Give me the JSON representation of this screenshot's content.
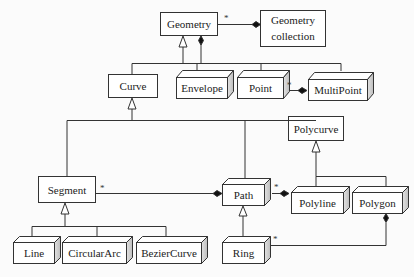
{
  "diagram": {
    "type": "UML class diagram",
    "classes": {
      "geometry": "Geometry",
      "geometry_collection_line1": "Geometry",
      "geometry_collection_line2": "collection",
      "curve": "Curve",
      "envelope": "Envelope",
      "point": "Point",
      "multipoint": "MultiPoint",
      "polycurve": "Polycurve",
      "segment": "Segment",
      "path": "Path",
      "polyline": "Polyline",
      "polygon": "Polygon",
      "line": "Line",
      "circular_arc": "CircularArc",
      "bezier_curve": "BezierCurve",
      "ring": "Ring"
    },
    "multiplicities": {
      "geometry_to_collection": "*",
      "point_to_multipoint": "*",
      "segment_to_path": "*",
      "path_to_polyline": "*",
      "ring_to_polygon": "*"
    },
    "relationships": [
      {
        "from": "Curve",
        "to": "Geometry",
        "kind": "generalization"
      },
      {
        "from": "Envelope",
        "to": "Geometry",
        "kind": "generalization"
      },
      {
        "from": "Point",
        "to": "Geometry",
        "kind": "generalization"
      },
      {
        "from": "MultiPoint",
        "to": "Geometry",
        "kind": "generalization"
      },
      {
        "from": "Geometry",
        "to": "Geometry collection",
        "kind": "composition",
        "multiplicity": "*"
      },
      {
        "from": "Point",
        "to": "MultiPoint",
        "kind": "composition",
        "multiplicity": "*"
      },
      {
        "from": "Segment",
        "to": "Curve",
        "kind": "generalization"
      },
      {
        "from": "Path",
        "to": "Curve",
        "kind": "generalization"
      },
      {
        "from": "Polycurve",
        "to": "Curve",
        "kind": "generalization"
      },
      {
        "from": "Polyline",
        "to": "Polycurve",
        "kind": "generalization"
      },
      {
        "from": "Polygon",
        "to": "Polycurve",
        "kind": "generalization"
      },
      {
        "from": "Segment",
        "to": "Path",
        "kind": "composition",
        "multiplicity": "*"
      },
      {
        "from": "Path",
        "to": "Polyline",
        "kind": "composition",
        "multiplicity": "*"
      },
      {
        "from": "Ring",
        "to": "Path",
        "kind": "generalization"
      },
      {
        "from": "Ring",
        "to": "Polygon",
        "kind": "composition",
        "multiplicity": "*"
      },
      {
        "from": "Line",
        "to": "Segment",
        "kind": "generalization"
      },
      {
        "from": "CircularArc",
        "to": "Segment",
        "kind": "generalization"
      },
      {
        "from": "BezierCurve",
        "to": "Segment",
        "kind": "generalization"
      }
    ]
  }
}
